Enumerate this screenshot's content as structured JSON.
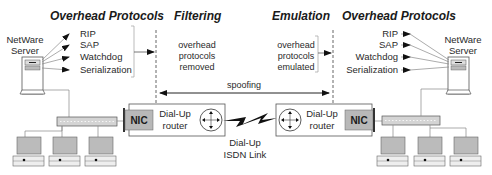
{
  "sections": {
    "left_title": "Overhead Protocols",
    "filtering_title": "Filtering",
    "emulation_title": "Emulation",
    "right_title": "Overhead Protocols"
  },
  "left_server": {
    "label_line1": "NetWare",
    "label_line2": "Server"
  },
  "right_server": {
    "label_line1": "NetWare",
    "label_line2": "Server"
  },
  "left_protocols": [
    "RIP",
    "SAP",
    "Watchdog",
    "Serialization"
  ],
  "right_protocols": [
    "RIP",
    "SAP",
    "Watchdog",
    "Serialization"
  ],
  "filtering_text": [
    "overhead",
    "protocols",
    "removed"
  ],
  "emulation_text": [
    "overhead",
    "protocols",
    "emulated"
  ],
  "spoofing_label": "spoofing",
  "left_router": {
    "nic_label": "NIC",
    "router_line1": "Dial-Up",
    "router_line2": "router"
  },
  "right_router": {
    "nic_label": "NIC",
    "router_line1": "Dial-Up",
    "router_line2": "router"
  },
  "link_label": {
    "line1": "Dial-Up",
    "line2": "ISDN Link"
  },
  "colors": {
    "nic_fill": "#b8b8b8",
    "device_fill": "#c8c8c8",
    "line": "#555555"
  }
}
